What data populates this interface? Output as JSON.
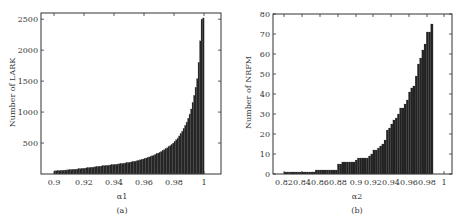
{
  "chart_data": [
    {
      "type": "bar",
      "title": "",
      "caption": "(a)",
      "xlabel": "α1",
      "ylabel": "Number of LARK",
      "xlim": [
        0.89,
        1.01
      ],
      "ylim": [
        0,
        2600
      ],
      "xticks": [
        "0.9",
        "0.92",
        "0.94",
        "0.96",
        "0.98",
        "1"
      ],
      "yticks": [
        "500",
        "1000",
        "1500",
        "2000",
        "2500"
      ],
      "grid": false,
      "bar_color": "#222222",
      "x_start": 0.9,
      "x_step": 0.001,
      "values": [
        50,
        52,
        54,
        56,
        58,
        60,
        62,
        64,
        66,
        68,
        70,
        72,
        74,
        76,
        78,
        80,
        83,
        86,
        89,
        92,
        95,
        98,
        101,
        104,
        107,
        110,
        113,
        116,
        119,
        122,
        125,
        128,
        131,
        134,
        137,
        140,
        143,
        146,
        149,
        152,
        155,
        158,
        161,
        164,
        167,
        170,
        174,
        178,
        182,
        186,
        190,
        195,
        200,
        205,
        210,
        216,
        222,
        228,
        235,
        242,
        250,
        258,
        266,
        275,
        284,
        294,
        304,
        315,
        326,
        338,
        350,
        363,
        377,
        391,
        406,
        422,
        440,
        458,
        478,
        500,
        525,
        552,
        582,
        615,
        650,
        690,
        735,
        785,
        840,
        900,
        970,
        1050,
        1150,
        1270,
        1400,
        1540,
        1800,
        2150,
        2500,
        2520
      ]
    },
    {
      "type": "bar",
      "title": "",
      "caption": "(b)",
      "xlabel": "α2",
      "ylabel": "Number of NRFM",
      "xlim": [
        0.81,
        1.01
      ],
      "ylim": [
        0,
        80
      ],
      "xticks": [
        "0.82",
        "0.84",
        "0.86",
        "0.88",
        "0.9",
        "0.92",
        "0.94",
        "0.96",
        "0.98",
        "1"
      ],
      "yticks": [
        "0",
        "10",
        "20",
        "30",
        "40",
        "50",
        "60",
        "70",
        "80"
      ],
      "grid": false,
      "bar_color": "#222222",
      "x_start": 0.82,
      "x_step": 0.0025,
      "values": [
        1,
        1,
        1,
        1,
        1,
        1,
        1,
        1,
        1,
        1,
        1,
        1,
        1,
        1,
        2,
        2,
        2,
        2,
        2,
        2,
        2,
        2,
        2,
        2,
        5,
        5,
        6,
        6,
        6,
        6,
        6,
        6,
        7,
        8,
        8,
        8,
        8,
        8,
        9,
        10,
        12,
        12,
        13,
        14,
        15,
        17,
        22,
        23,
        25,
        27,
        28,
        30,
        33,
        33,
        35,
        37,
        41,
        43,
        44,
        49,
        55,
        58,
        62,
        65,
        71,
        71,
        75
      ]
    }
  ]
}
